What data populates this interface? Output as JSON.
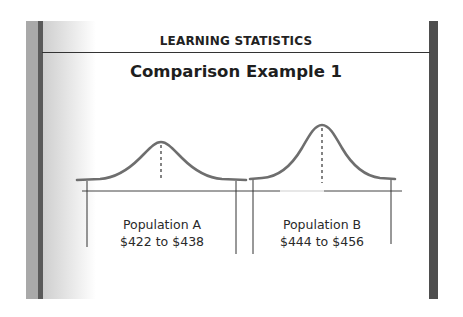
{
  "header": {
    "section_title": "LEARNING STATISTICS",
    "slide_title": "Comparison Example 1"
  },
  "colors": {
    "curve": "#6e6e6e",
    "lines": "#3a3a3a",
    "right_bar": "#4e4e4e",
    "left_stripe": "#5a5a5a"
  },
  "populations": [
    {
      "name": "Population A",
      "range": "$422 to $438"
    },
    {
      "name": "Population B",
      "range": "$444 to $456"
    }
  ]
}
